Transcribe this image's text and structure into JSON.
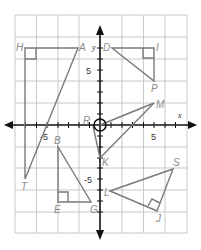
{
  "diagram": {
    "type": "coordinate-plane",
    "axes": {
      "x_label": "x",
      "y_label": "y",
      "tick_labels": {
        "x_neg": "-5",
        "x_pos": "5",
        "y_pos": "5",
        "y_neg": "-5"
      }
    },
    "colors": {
      "grid": "#c8c8c8",
      "axis": "#111111",
      "shape": "#7a7a7a",
      "label": "#8a8a8a"
    },
    "points": {
      "H": "H",
      "A": "A",
      "T": "T",
      "D": "D",
      "I": "I",
      "P": "P",
      "M": "M",
      "R": "R",
      "K": "K",
      "B": "B",
      "E": "E",
      "G": "G",
      "L": "L",
      "S": "S",
      "J": "J"
    },
    "shapes": [
      {
        "name": "triangle-HAT",
        "vertices": [
          "H(-7,7)",
          "A(-2,7)",
          "T(-7,-5)"
        ],
        "right_angle": "H"
      },
      {
        "name": "triangle-DIP",
        "vertices": [
          "D(1,7)",
          "I(5,7)",
          "P(5,3)"
        ],
        "right_angle": "I"
      },
      {
        "name": "triangle-RMK",
        "vertices": [
          "R(0,0)",
          "M(5,2)",
          "K(0,-3)"
        ]
      },
      {
        "name": "triangle-BEG",
        "vertices": [
          "B(-4,-2.5)",
          "E(-4,-7)",
          "G(-1,-7)"
        ],
        "right_angle": "E"
      },
      {
        "name": "triangle-LSJ",
        "vertices": [
          "L(1,-6)",
          "S(7,-4)",
          "J(5,-8)"
        ],
        "right_angle": "J"
      }
    ]
  }
}
